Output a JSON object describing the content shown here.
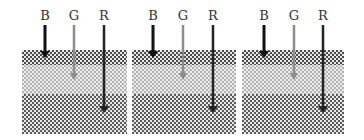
{
  "diagram": {
    "colors": {
      "arrow_B": "#111111",
      "arrow_G": "#8c8c8c",
      "arrow_R": "#222222",
      "layer_top_dark": "#4a4a4a",
      "layer_middle_light": "#b4b4b4",
      "layer_bottom_dark": "#5c5c5c"
    },
    "panels": [
      {
        "left": 22,
        "width": 105,
        "labels": [
          {
            "text": "B",
            "x": 23
          },
          {
            "text": "G",
            "x": 52
          },
          {
            "text": "R",
            "x": 82
          }
        ]
      },
      {
        "left": 132,
        "width": 104,
        "labels": [
          {
            "text": "B",
            "x": 21
          },
          {
            "text": "G",
            "x": 51
          },
          {
            "text": "R",
            "x": 81
          }
        ]
      },
      {
        "left": 242,
        "width": 102,
        "labels": [
          {
            "text": "B",
            "x": 22
          },
          {
            "text": "G",
            "x": 52
          },
          {
            "text": "R",
            "x": 81
          }
        ]
      }
    ],
    "layers": [
      {
        "name": "top",
        "y_start": 50,
        "y_end": 65
      },
      {
        "name": "middle",
        "y_start": 65,
        "y_end": 94
      },
      {
        "name": "bottom",
        "y_start": 94,
        "y_end": 134
      }
    ],
    "arrows": [
      {
        "label": "B",
        "y_start": 25,
        "y_end": 58,
        "penetrates": "top layer"
      },
      {
        "label": "G",
        "y_start": 25,
        "y_end": 80,
        "penetrates": "middle layer"
      },
      {
        "label": "R",
        "y_start": 25,
        "y_end": 113,
        "penetrates": "bottom layer"
      }
    ]
  }
}
